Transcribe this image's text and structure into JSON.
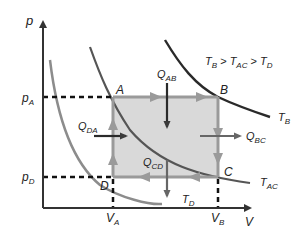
{
  "axes": {
    "y_label": "p",
    "x_label": "V",
    "y_ticks": [
      {
        "main": "p",
        "sub": "A"
      },
      {
        "main": "p",
        "sub": "D"
      }
    ],
    "x_ticks": [
      {
        "main": "V",
        "sub": "A"
      },
      {
        "main": "V",
        "sub": "B"
      }
    ]
  },
  "points": [
    {
      "name": "A",
      "x": 113,
      "y": 97
    },
    {
      "name": "B",
      "x": 218,
      "y": 97
    },
    {
      "name": "C",
      "x": 218,
      "y": 177
    },
    {
      "name": "D",
      "x": 113,
      "y": 177
    }
  ],
  "isotherms": [
    {
      "main": "T",
      "sub": "B"
    },
    {
      "main": "T",
      "sub": "AC"
    },
    {
      "main": "T",
      "sub": "D"
    }
  ],
  "heat_flows": [
    {
      "main": "Q",
      "sub": "AB",
      "direction": "in"
    },
    {
      "main": "Q",
      "sub": "BC",
      "direction": "out"
    },
    {
      "main": "Q",
      "sub": "CD",
      "direction": "out"
    },
    {
      "main": "Q",
      "sub": "DA",
      "direction": "in"
    }
  ],
  "relation": {
    "parts": [
      {
        "main": "T",
        "sub": "B"
      },
      {
        "op": " > "
      },
      {
        "main": "T",
        "sub": "AC"
      },
      {
        "op": " > "
      },
      {
        "main": "T",
        "sub": "D"
      }
    ]
  },
  "colors": {
    "cycle_fill": "#d9d9d9",
    "cycle_edge": "#9a9a9a",
    "isotherm_dark": "#3a3a3a",
    "isotherm_mid": "#666666",
    "isotherm_light": "#8c8c8c",
    "heat_arrow": "#3a3a3a",
    "axis": "#333333"
  }
}
